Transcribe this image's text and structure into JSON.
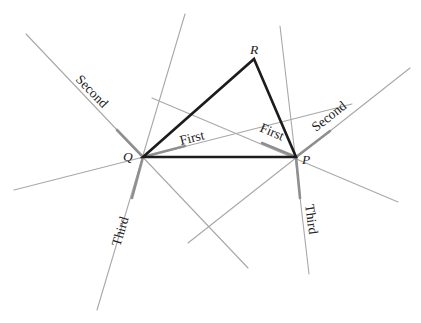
{
  "diagram": {
    "colors": {
      "triangle": "#1c1c1c",
      "construction_line": "#a8a8a8",
      "emphasized_segment": "#8f8f8f",
      "background": "#ffffff"
    },
    "vertices": {
      "Q": {
        "label": "Q",
        "x": 143,
        "y": 157
      },
      "P": {
        "label": "P",
        "x": 296,
        "y": 157
      },
      "R": {
        "label": "R",
        "x": 254,
        "y": 59
      }
    },
    "labels": {
      "q_first": "First",
      "q_second": "Second",
      "q_third": "Third",
      "p_first": "First",
      "p_second": "Second",
      "p_third": "Third"
    }
  }
}
